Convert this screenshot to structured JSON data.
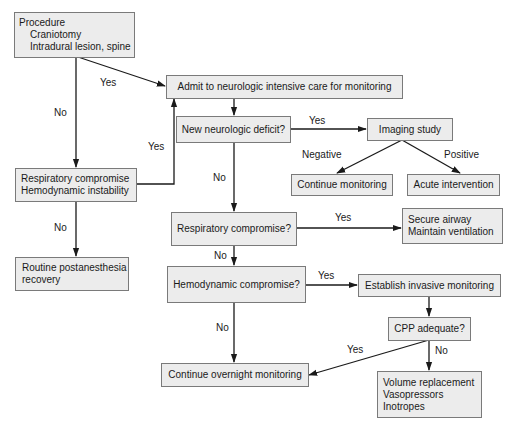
{
  "nodes": {
    "procedure": {
      "lines": [
        "Procedure",
        "Craniotomy",
        "Intradural lesion, spine"
      ]
    },
    "admit": {
      "text": "Admit to neurologic intensive care for monitoring"
    },
    "new_deficit": {
      "text": "New neurologic deficit?"
    },
    "imaging": {
      "text": "Imaging study"
    },
    "continue_monitoring": {
      "text": "Continue monitoring"
    },
    "acute_intervention": {
      "text": "Acute intervention"
    },
    "resp_hemo_instability": {
      "lines": [
        "Respiratory compromise",
        "Hemodynamic instability"
      ]
    },
    "routine_recovery": {
      "lines": [
        "Routine postanesthesia",
        "recovery"
      ]
    },
    "resp_compromise": {
      "text": "Respiratory compromise?"
    },
    "secure_airway": {
      "lines": [
        "Secure airway",
        "Maintain ventilation"
      ]
    },
    "hemo_compromise": {
      "text": "Hemodynamic compromise?"
    },
    "invasive_monitoring": {
      "text": "Establish invasive monitoring"
    },
    "cpp_adequate": {
      "text": "CPP adequate?"
    },
    "overnight_monitoring": {
      "text": "Continue overnight monitoring"
    },
    "volume_replacement": {
      "lines": [
        "Volume replacement",
        "Vasopressors",
        "Inotropes"
      ]
    }
  },
  "edge_labels": {
    "procedure_yes": "Yes",
    "procedure_no": "No",
    "instability_yes": "Yes",
    "instability_no": "No",
    "deficit_yes": "Yes",
    "deficit_no": "No",
    "imaging_negative": "Negative",
    "imaging_positive": "Positive",
    "resp_yes": "Yes",
    "resp_no": "No",
    "hemo_yes": "Yes",
    "hemo_no": "No",
    "cpp_yes": "Yes",
    "cpp_no": "No"
  },
  "colors": {
    "node_fill": "#ececec",
    "node_border": "#7a7a7a",
    "edge": "#1a1a1a"
  }
}
